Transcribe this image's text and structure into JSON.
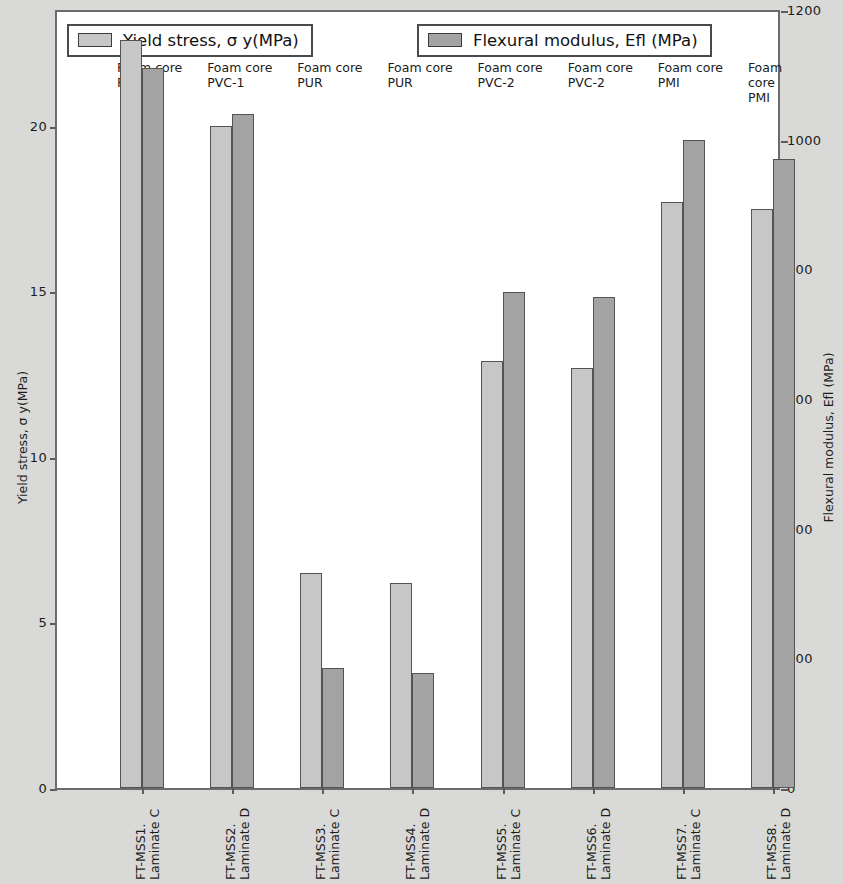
{
  "legend": {
    "left": {
      "label": "Yield stress, σ y(MPa)",
      "color": "#c7c7c7"
    },
    "right": {
      "label": "Flexural modulus, Efl (MPa)",
      "color": "#a3a3a3"
    }
  },
  "axes": {
    "left_title": "Yield stress, σ y(MPa)",
    "right_title": "Flexural modulus, Efl (MPa)",
    "left_ticks": [
      "0",
      "5",
      "10",
      "15",
      "20"
    ],
    "right_ticks": [
      "0",
      "200",
      "400",
      "600",
      "800",
      "1000",
      "1200"
    ]
  },
  "chart_data": {
    "type": "bar",
    "title": "",
    "xlabel": "",
    "ylabel": "Yield stress, σ y(MPa)",
    "y2label": "Flexural modulus, Efl (MPa)",
    "ylim": [
      0,
      23.5
    ],
    "y2lim": [
      0,
      1200
    ],
    "grid": false,
    "legend_position": "top",
    "categories": [
      "FT-MSS1.\nLaminate C",
      "FT-MSS2.\nLaminate D",
      "FT-MSS3.\nLaminate C",
      "FT-MSS4.\nLaminate D",
      "FT-MSS5.\nLaminate C",
      "FT-MSS6.\nLaminate D",
      "FT-MSS7.\nLaminate C",
      "FT-MSS8.\nLaminate D"
    ],
    "group_headers": [
      "Foam core\nPVC-1",
      "Foam core\nPVC-1",
      "Foam core\nPUR",
      "Foam core\nPUR",
      "Foam core\nPVC-2",
      "Foam core\nPVC-2",
      "Foam core\nPMI",
      "Foam core\nPMI"
    ],
    "series": [
      {
        "name": "Yield stress, σ y(MPa)",
        "axis": "left",
        "color": "#c7c7c7",
        "values": [
          22.6,
          20.0,
          6.5,
          6.2,
          12.9,
          12.7,
          17.7,
          17.5
        ]
      },
      {
        "name": "Flexural modulus, Efl (MPa)",
        "axis": "right",
        "color": "#a3a3a3",
        "values": [
          1110,
          1040,
          185,
          178,
          765,
          757,
          1000,
          970
        ]
      }
    ]
  }
}
